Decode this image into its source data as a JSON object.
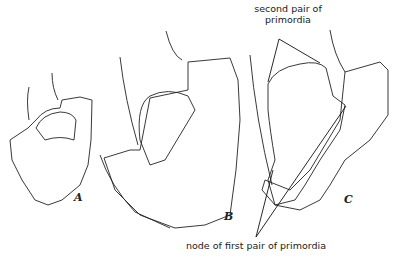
{
  "figure": {
    "panels": [
      {
        "id": "A",
        "label": "A"
      },
      {
        "id": "B",
        "label": "B"
      },
      {
        "id": "C",
        "label": "C"
      }
    ],
    "annotations": {
      "second_pair_line1": "second pair of",
      "second_pair_line2": "primordia",
      "node_first_pair": "node of first pair of primordia"
    },
    "colors": {
      "ink": "#222222",
      "background": "#ffffff"
    }
  }
}
